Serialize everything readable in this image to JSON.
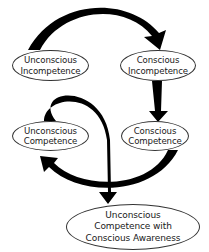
{
  "diagram": {
    "type": "flow-cycle",
    "nodes": [
      {
        "id": "unconscious-incompetence",
        "lines": [
          "Unconscious",
          "Incompetence"
        ]
      },
      {
        "id": "conscious-incompetence",
        "lines": [
          "Conscious",
          "Incompetence"
        ]
      },
      {
        "id": "unconscious-competence",
        "lines": [
          "Unconscious",
          "Competence"
        ]
      },
      {
        "id": "conscious-competence",
        "lines": [
          "Conscious",
          "Competence"
        ]
      },
      {
        "id": "unconscious-competence-with-awareness",
        "lines": [
          "Unconscious",
          "Competence with",
          "Conscious Awareness"
        ]
      }
    ],
    "edges": [
      {
        "from": "unconscious-incompetence",
        "to": "conscious-incompetence",
        "style": "thick-curved-arrow"
      },
      {
        "from": "conscious-incompetence",
        "to": "conscious-competence",
        "style": "thick-straight-arrow"
      },
      {
        "from": "conscious-competence",
        "to": "unconscious-competence",
        "style": "thick-curved-arrow"
      },
      {
        "from": "unconscious-competence",
        "to": "unconscious-competence-with-awareness",
        "style": "thick-curved-arrow"
      }
    ],
    "colors": {
      "arrow": "#000000",
      "node_border": "#333333",
      "node_fill": "#ffffff",
      "text": "#1a1a1a"
    }
  }
}
